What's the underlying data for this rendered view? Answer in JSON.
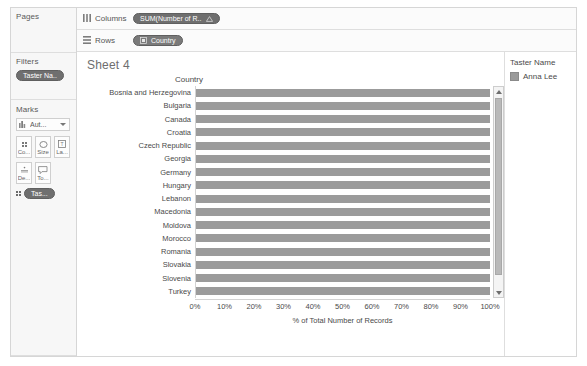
{
  "sidebar": {
    "pages": {
      "title": "Pages",
      "items": []
    },
    "filters": {
      "title": "Filters",
      "items": [
        {
          "label": "Taster Na..",
          "icon": "filter-pill"
        }
      ]
    },
    "marks": {
      "title": "Marks",
      "type_selector": {
        "label": "Aut...",
        "icon": "bar-chart-icon",
        "caret": "chevron-down-icon"
      },
      "buttons": [
        {
          "name": "color",
          "label": "Co...",
          "icon": "color-dots-icon"
        },
        {
          "name": "size",
          "label": "Size",
          "icon": "size-icon"
        },
        {
          "name": "label",
          "label": "La...",
          "icon": "label-icon"
        },
        {
          "name": "detail",
          "label": "De...",
          "icon": "detail-icon"
        },
        {
          "name": "tooltip",
          "label": "To...",
          "icon": "tooltip-icon"
        }
      ],
      "assignments": [
        {
          "label": "Tas...",
          "icon": "color-dots-icon"
        }
      ]
    }
  },
  "shelves": [
    {
      "name": "columns",
      "label": "Columns",
      "icon": "columns-icon",
      "pills": [
        {
          "label": "SUM(Number of R..",
          "icon": "delta-icon",
          "kind": "measure"
        }
      ]
    },
    {
      "name": "rows",
      "label": "Rows",
      "icon": "rows-icon",
      "pills": [
        {
          "label": "Country",
          "icon": "geo-icon",
          "kind": "dimension"
        }
      ]
    }
  ],
  "sheet": {
    "title": "Sheet 4"
  },
  "legend": {
    "title": "Taster Name",
    "items": [
      {
        "label": "Anna Lee",
        "color": "#9a9a9a"
      }
    ]
  },
  "scrollbar": {
    "up_icon": "chevron-up-icon",
    "down_icon": "chevron-down-icon"
  },
  "colors": {
    "bar": "#9b9b9b",
    "pill": "#6f6f6f",
    "panel": "#f7f7f7",
    "border": "#d6d6d6",
    "text": "#4a4a4a"
  },
  "chart_data": {
    "type": "bar",
    "orientation": "horizontal",
    "title": "Sheet 4",
    "row_field_header": "Country",
    "categories": [
      "Bosnia and Herzegovina",
      "Bulgaria",
      "Canada",
      "Croatia",
      "Czech Republic",
      "Georgia",
      "Germany",
      "Hungary",
      "Lebanon",
      "Macedonia",
      "Moldova",
      "Morocco",
      "Romania",
      "Slovakia",
      "Slovenia",
      "Turkey"
    ],
    "values": [
      100,
      100,
      100,
      100,
      100,
      100,
      100,
      100,
      100,
      100,
      100,
      100,
      100,
      100,
      100,
      100
    ],
    "series": [
      {
        "name": "Anna Lee",
        "values": [
          100,
          100,
          100,
          100,
          100,
          100,
          100,
          100,
          100,
          100,
          100,
          100,
          100,
          100,
          100,
          100
        ]
      }
    ],
    "xlabel": "% of Total Number of Records",
    "ylabel": "Country",
    "xlim": [
      0,
      100
    ],
    "xticks": [
      0,
      10,
      20,
      30,
      40,
      50,
      60,
      70,
      80,
      90,
      100
    ],
    "xticklabels": [
      "0%",
      "10%",
      "20%",
      "30%",
      "40%",
      "50%",
      "60%",
      "70%",
      "80%",
      "90%",
      "100%"
    ],
    "grid": false,
    "legend_position": "right"
  }
}
